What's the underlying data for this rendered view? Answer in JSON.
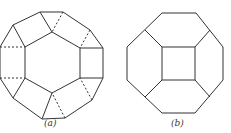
{
  "figures": [
    {
      "id": "a",
      "caption": "(a)",
      "description": "Dodecagonal (12-sided) outline with inner hexagon; solid and dashed edges",
      "outer_polygon": [
        [
          40,
          12
        ],
        [
          63,
          12
        ],
        [
          90,
          30
        ],
        [
          103,
          48
        ],
        [
          103,
          78
        ],
        [
          92,
          100
        ],
        [
          65,
          118
        ],
        [
          42,
          119
        ],
        [
          13,
          98
        ],
        [
          0,
          78
        ],
        [
          0,
          47
        ],
        [
          13,
          25
        ]
      ],
      "inner_polygon": [
        [
          52,
          32
        ],
        [
          80,
          48
        ],
        [
          80,
          78
        ],
        [
          52,
          93
        ],
        [
          25,
          78
        ],
        [
          25,
          47
        ]
      ],
      "solid_edges": [
        [
          [
            13,
            25
          ],
          [
            25,
            47
          ]
        ],
        [
          [
            40,
            12
          ],
          [
            52,
            32
          ]
        ],
        [
          [
            80,
            48
          ],
          [
            103,
            48
          ]
        ],
        [
          [
            80,
            78
          ],
          [
            103,
            78
          ]
        ],
        [
          [
            25,
            78
          ],
          [
            13,
            98
          ]
        ],
        [
          [
            52,
            93
          ],
          [
            42,
            119
          ]
        ]
      ],
      "dashed_edges": [
        [
          [
            63,
            12
          ],
          [
            52,
            32
          ]
        ],
        [
          [
            90,
            30
          ],
          [
            80,
            48
          ]
        ],
        [
          [
            0,
            47
          ],
          [
            25,
            47
          ]
        ],
        [
          [
            0,
            78
          ],
          [
            25,
            78
          ]
        ],
        [
          [
            92,
            100
          ],
          [
            80,
            78
          ]
        ],
        [
          [
            65,
            118
          ],
          [
            52,
            93
          ]
        ]
      ]
    },
    {
      "id": "b",
      "caption": "(b)",
      "description": "Octagon with inner square connected to diagonal edge midpoints",
      "outer_polygon": [
        [
          162,
          13
        ],
        [
          196,
          13
        ],
        [
          223,
          47
        ],
        [
          223,
          80
        ],
        [
          195,
          113
        ],
        [
          162,
          113
        ],
        [
          127,
          80
        ],
        [
          127,
          47
        ]
      ],
      "inner_square": [
        [
          162,
          47
        ],
        [
          195,
          47
        ],
        [
          195,
          80
        ],
        [
          162,
          80
        ]
      ],
      "connectors": [
        [
          [
            162,
            47
          ],
          [
            145,
            30
          ]
        ],
        [
          [
            195,
            47
          ],
          [
            210,
            30
          ]
        ],
        [
          [
            195,
            80
          ],
          [
            210,
            97
          ]
        ],
        [
          [
            162,
            80
          ],
          [
            145,
            97
          ]
        ]
      ]
    }
  ],
  "colors": {
    "line": "#333333",
    "background": "#ffffff"
  }
}
